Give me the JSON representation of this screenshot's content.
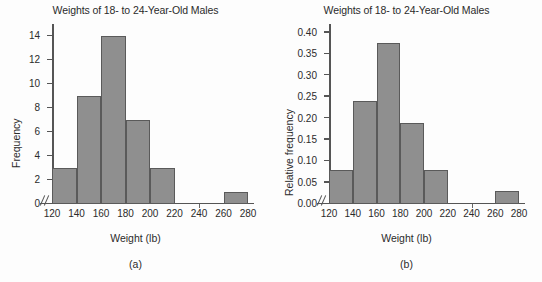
{
  "figure": {
    "background_color": "#fdfdfd",
    "bar_fill_color": "#8f8f8f",
    "bar_edge_color": "#5a5a5a",
    "axis_color": "#555555",
    "text_color": "#2b2b2b"
  },
  "chart_data": [
    {
      "type": "bar",
      "panel": "a",
      "caption": "(a)",
      "title": "Weights of 18- to 24-Year-Old Males",
      "xlabel": "Weight (lb)",
      "ylabel": "Frequency",
      "grid": false,
      "legend": "none",
      "histogram": true,
      "bin_width": 20,
      "xlim": [
        120,
        280
      ],
      "ylim": [
        0,
        15
      ],
      "xticks": [
        120,
        140,
        160,
        180,
        200,
        220,
        240,
        260,
        280
      ],
      "xtick_labels": [
        "120",
        "140",
        "160",
        "180",
        "200",
        "220",
        "240",
        "260",
        "280"
      ],
      "yticks": [
        0,
        2,
        4,
        6,
        8,
        10,
        12,
        14
      ],
      "ytick_labels": [
        "0",
        "2",
        "4",
        "6",
        "8",
        "10",
        "12",
        "14"
      ],
      "axis_break_at_origin": true,
      "bins": [
        {
          "left": 120,
          "right": 140,
          "value": 3
        },
        {
          "left": 140,
          "right": 160,
          "value": 9
        },
        {
          "left": 160,
          "right": 180,
          "value": 14
        },
        {
          "left": 180,
          "right": 200,
          "value": 7
        },
        {
          "left": 200,
          "right": 220,
          "value": 3
        },
        {
          "left": 220,
          "right": 240,
          "value": 0
        },
        {
          "left": 240,
          "right": 260,
          "value": 0
        },
        {
          "left": 260,
          "right": 280,
          "value": 1
        }
      ],
      "categories": [
        "120-140",
        "140-160",
        "160-180",
        "180-200",
        "200-220",
        "220-240",
        "240-260",
        "260-280"
      ],
      "values": [
        3,
        9,
        14,
        7,
        3,
        0,
        0,
        1
      ]
    },
    {
      "type": "bar",
      "panel": "b",
      "caption": "(b)",
      "title": "Weights of 18- to 24-Year-Old Males",
      "xlabel": "Weight (lb)",
      "ylabel": "Relative frequency",
      "grid": false,
      "legend": "none",
      "histogram": true,
      "bin_width": 20,
      "xlim": [
        120,
        280
      ],
      "ylim": [
        0,
        0.42
      ],
      "xticks": [
        120,
        140,
        160,
        180,
        200,
        220,
        240,
        260,
        280
      ],
      "xtick_labels": [
        "120",
        "140",
        "160",
        "180",
        "200",
        "220",
        "240",
        "260",
        "280"
      ],
      "yticks": [
        0.0,
        0.05,
        0.1,
        0.15,
        0.2,
        0.25,
        0.3,
        0.35,
        0.4
      ],
      "ytick_labels": [
        "0.00",
        "0.05",
        "0.10",
        "0.15",
        "0.20",
        "0.25",
        "0.30",
        "0.35",
        "0.40"
      ],
      "axis_break_at_origin": true,
      "bins": [
        {
          "left": 120,
          "right": 140,
          "value": 0.08
        },
        {
          "left": 140,
          "right": 160,
          "value": 0.24
        },
        {
          "left": 160,
          "right": 180,
          "value": 0.375
        },
        {
          "left": 180,
          "right": 200,
          "value": 0.19
        },
        {
          "left": 200,
          "right": 220,
          "value": 0.08
        },
        {
          "left": 220,
          "right": 240,
          "value": 0
        },
        {
          "left": 240,
          "right": 260,
          "value": 0
        },
        {
          "left": 260,
          "right": 280,
          "value": 0.03
        }
      ],
      "categories": [
        "120-140",
        "140-160",
        "160-180",
        "180-200",
        "200-220",
        "220-240",
        "240-260",
        "260-280"
      ],
      "values": [
        0.08,
        0.24,
        0.375,
        0.19,
        0.08,
        0,
        0,
        0.03
      ]
    }
  ]
}
